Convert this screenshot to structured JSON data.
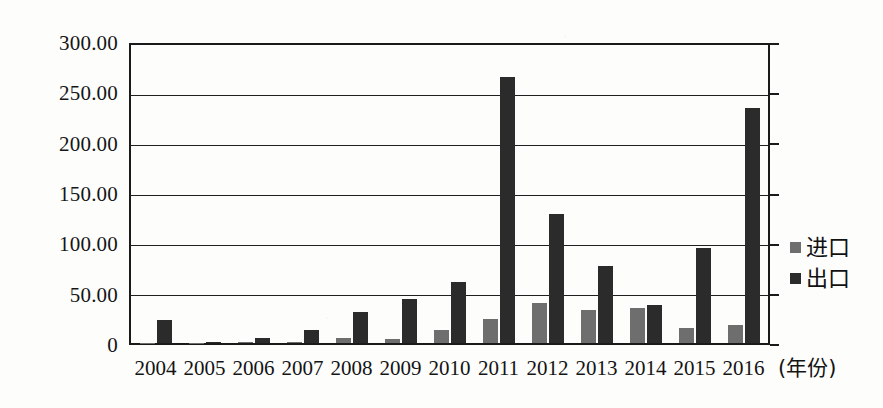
{
  "chart_data": {
    "type": "bar",
    "title": "",
    "subtitle": "",
    "xlabel": "(年份)",
    "ylabel": "",
    "categories": [
      "2004",
      "2005",
      "2006",
      "2007",
      "2008",
      "2009",
      "2010",
      "2011",
      "2012",
      "2013",
      "2014",
      "2015",
      "2016"
    ],
    "series": [
      {
        "name": "进口",
        "color": "#6e6e6e",
        "values": [
          0.3,
          0.4,
          1.2,
          0.8,
          5.0,
          4.0,
          13.0,
          24.0,
          40.0,
          33.0,
          35.0,
          15.0,
          18.0
        ]
      },
      {
        "name": "出口",
        "color": "#2b2b2b",
        "values": [
          23.0,
          1.5,
          5.0,
          13.0,
          31.0,
          44.0,
          61.0,
          268.0,
          130.0,
          78.0,
          38.0,
          96.0,
          237.0
        ]
      }
    ],
    "ylim": [
      0,
      300
    ],
    "ytick_values": [
      0,
      50,
      100,
      150,
      200,
      250,
      300
    ],
    "ytick_labels": [
      "0",
      "50.00",
      "100.00",
      "150.00",
      "200.00",
      "250.00",
      "300.00"
    ],
    "grid": true,
    "grid_axis": "y",
    "legend_position": "right"
  },
  "legend": {
    "entries": [
      {
        "label": "进口",
        "swatch": "#6e6e6e"
      },
      {
        "label": "出口",
        "swatch": "#2b2b2b"
      }
    ]
  },
  "axis": {
    "x_title": "(年份)"
  }
}
